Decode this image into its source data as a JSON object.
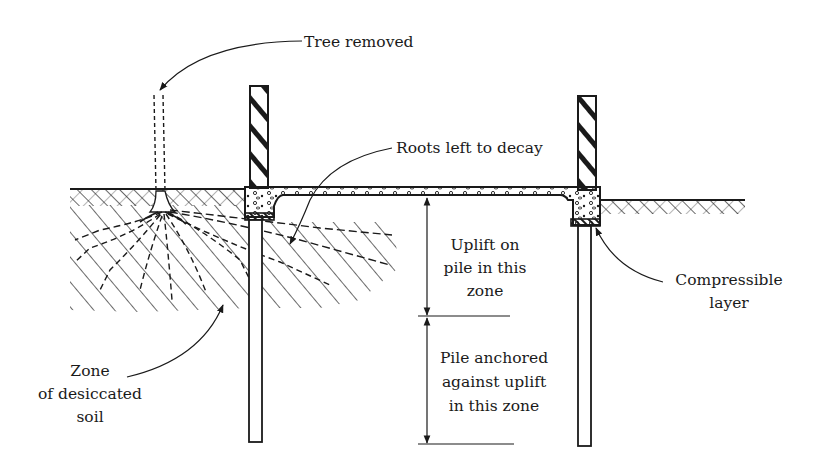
{
  "diagram": {
    "type": "pile foundation cross-section",
    "labels": {
      "tree_removed": "Tree removed",
      "roots_left": "Roots left to decay",
      "uplift_zone": [
        "Uplift on",
        "pile in this",
        "zone"
      ],
      "anchored_zone": [
        "Pile anchored",
        "against uplift",
        "in this zone"
      ],
      "compressible_layer": [
        "Compressible",
        "layer"
      ],
      "desiccated_zone": [
        "Zone",
        "of desiccated",
        "soil"
      ]
    },
    "colors": {
      "ink": "#1a1a1a",
      "background": "#ffffff"
    }
  }
}
